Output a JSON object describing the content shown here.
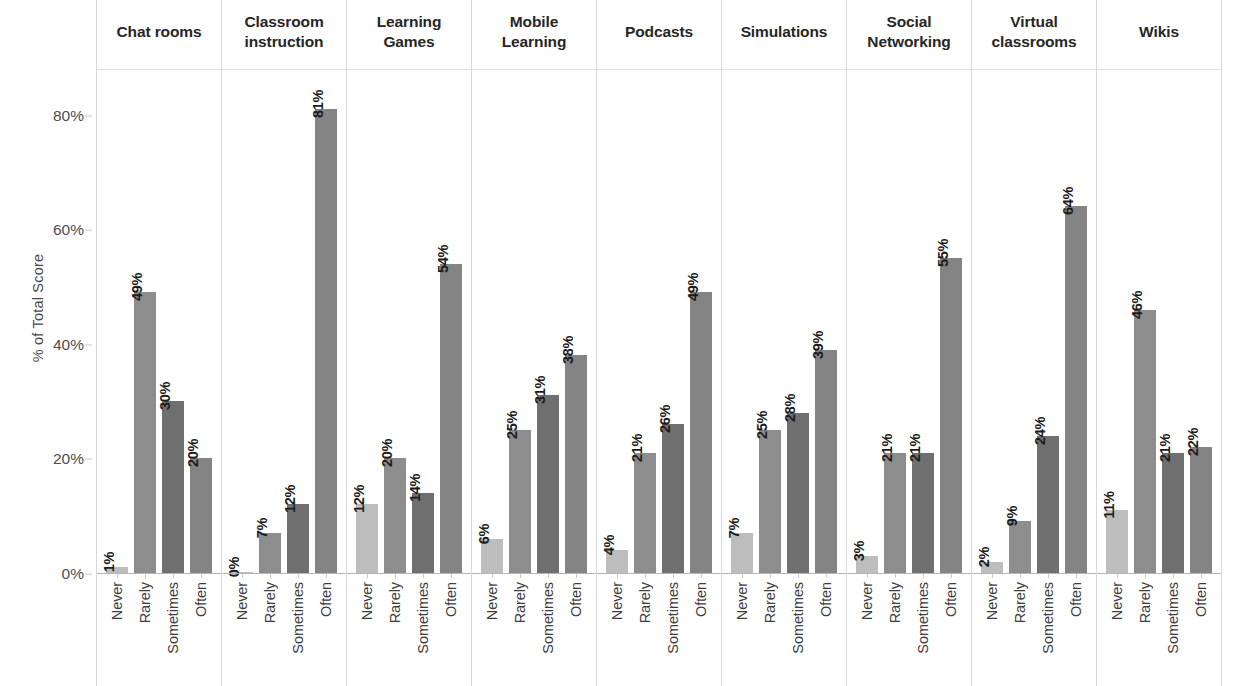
{
  "chart_data": {
    "type": "bar",
    "title": "",
    "subtitle": "",
    "xlabel": "",
    "ylabel": "% of Total Score",
    "ylim": [
      0,
      88
    ],
    "yticks": [
      0,
      20,
      40,
      60,
      80
    ],
    "ytick_labels": [
      "0%",
      "20%",
      "40%",
      "60%",
      "80%"
    ],
    "grid": false,
    "legend": "none",
    "facet_layout": "1 row x 9 columns",
    "categories": [
      "Never",
      "Rarely",
      "Sometimes",
      "Often"
    ],
    "panels": [
      {
        "title": "Chat rooms",
        "title_lines": [
          "Chat rooms"
        ],
        "values": [
          1,
          49,
          30,
          20
        ],
        "value_labels": [
          "1%",
          "49%",
          "30%",
          "20%"
        ]
      },
      {
        "title": "Classroom instruction",
        "title_lines": [
          "Classroom",
          "instruction"
        ],
        "values": [
          0,
          7,
          12,
          81
        ],
        "value_labels": [
          "0%",
          "7%",
          "12%",
          "81%"
        ]
      },
      {
        "title": "Learning Games",
        "title_lines": [
          "Learning",
          "Games"
        ],
        "values": [
          12,
          20,
          14,
          54
        ],
        "value_labels": [
          "12%",
          "20%",
          "14%",
          "54%"
        ]
      },
      {
        "title": "Mobile Learning",
        "title_lines": [
          "Mobile",
          "Learning"
        ],
        "values": [
          6,
          25,
          31,
          38
        ],
        "value_labels": [
          "6%",
          "25%",
          "31%",
          "38%"
        ]
      },
      {
        "title": "Podcasts",
        "title_lines": [
          "Podcasts"
        ],
        "values": [
          4,
          21,
          26,
          49
        ],
        "value_labels": [
          "4%",
          "21%",
          "26%",
          "49%"
        ]
      },
      {
        "title": "Simulations",
        "title_lines": [
          "Simulations"
        ],
        "values": [
          7,
          25,
          28,
          39
        ],
        "value_labels": [
          "7%",
          "25%",
          "28%",
          "39%"
        ]
      },
      {
        "title": "Social Networking",
        "title_lines": [
          "Social",
          "Networking"
        ],
        "values": [
          3,
          21,
          21,
          55
        ],
        "value_labels": [
          "3%",
          "21%",
          "21%",
          "55%"
        ]
      },
      {
        "title": "Virtual classrooms",
        "title_lines": [
          "Virtual",
          "classrooms"
        ],
        "values": [
          2,
          9,
          24,
          64
        ],
        "value_labels": [
          "2%",
          "9%",
          "24%",
          "64%"
        ]
      },
      {
        "title": "Wikis",
        "title_lines": [
          "Wikis"
        ],
        "values": [
          11,
          46,
          21,
          22
        ],
        "value_labels": [
          "11%",
          "46%",
          "21%",
          "22%"
        ]
      }
    ],
    "series_colors": {
      "Never": "#bdbdbd",
      "Rarely": "#8d8d8d",
      "Sometimes": "#6f6f6f",
      "Often": "#848484"
    },
    "colors": {
      "background": "#ffffff",
      "panel_border": "#d9d9d9",
      "axis_line": "#b5b5b5",
      "tick_text": "#4d4d4d",
      "title_text": "#262626",
      "value_label_text": "#1c1c1c"
    }
  }
}
